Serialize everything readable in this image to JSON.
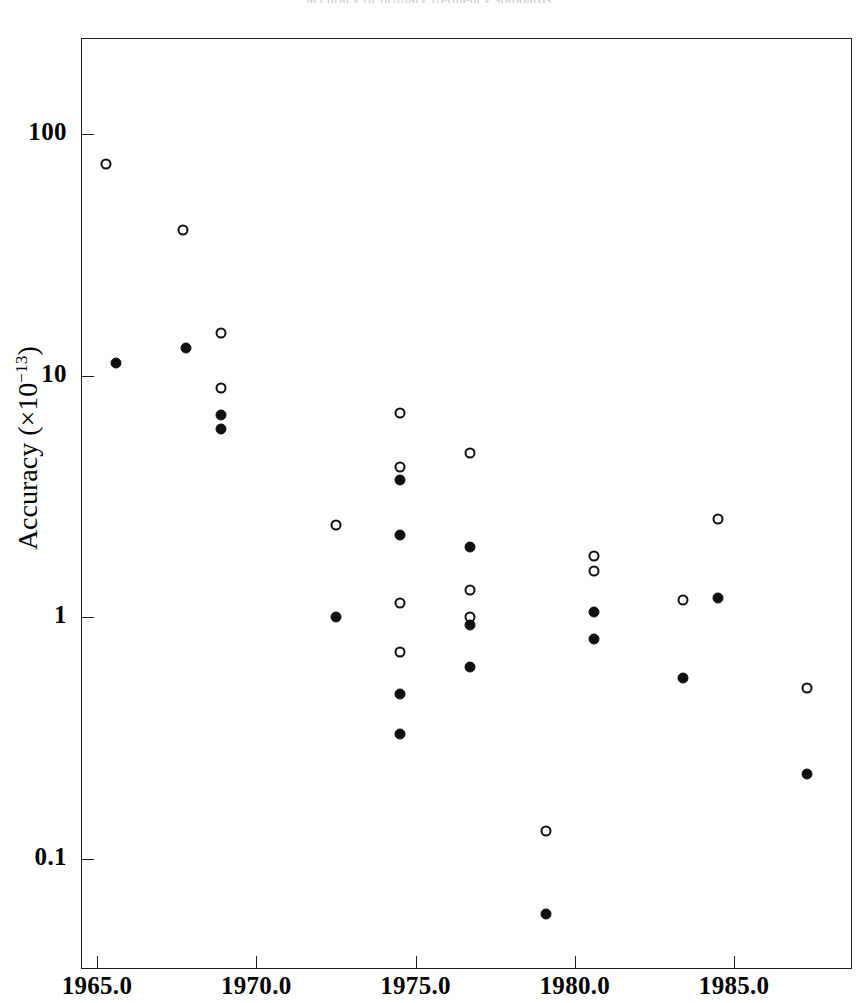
{
  "figure": {
    "title_sliver": "accuracy of primary frequency standards",
    "background": "#ffffff",
    "ink_color": "#101010"
  },
  "axes": {
    "x": {
      "label": "",
      "scale": "linear",
      "ticks": [
        "1965.0",
        "1970.0",
        "1975.0",
        "1980.0",
        "1985.0"
      ],
      "tick_values": [
        1965.0,
        1970.0,
        1975.0,
        1980.0,
        1985.0
      ],
      "range": [
        1964.5,
        1988.7
      ]
    },
    "y": {
      "label": "Accuracy (×10",
      "label_exponent": "−13",
      "label_close": ")",
      "scale": "log",
      "ticks": [
        "100",
        "10",
        "1",
        "0.1"
      ],
      "tick_values": [
        100,
        10,
        1,
        0.1
      ],
      "range": [
        0.035,
        250
      ]
    }
  },
  "chart_data": {
    "type": "scatter",
    "title": "",
    "xlabel": "",
    "ylabel": "Accuracy (×10⁻¹³)",
    "xlim": [
      1964.5,
      1988.7
    ],
    "ylim": [
      0.035,
      250
    ],
    "yscale": "log",
    "grid": false,
    "legend": "none",
    "series": [
      {
        "name": "open-circle",
        "marker": "open circle",
        "color": "#101010",
        "points": [
          {
            "x": 1965.3,
            "y": 75
          },
          {
            "x": 1967.7,
            "y": 40
          },
          {
            "x": 1968.9,
            "y": 15
          },
          {
            "x": 1968.9,
            "y": 8.9
          },
          {
            "x": 1972.5,
            "y": 2.4
          },
          {
            "x": 1974.5,
            "y": 7.0
          },
          {
            "x": 1974.5,
            "y": 4.2
          },
          {
            "x": 1974.5,
            "y": 1.15
          },
          {
            "x": 1974.5,
            "y": 0.72
          },
          {
            "x": 1976.7,
            "y": 4.8
          },
          {
            "x": 1976.7,
            "y": 1.3
          },
          {
            "x": 1976.7,
            "y": 1.0
          },
          {
            "x": 1979.1,
            "y": 0.13
          },
          {
            "x": 1980.6,
            "y": 1.8
          },
          {
            "x": 1980.6,
            "y": 1.55
          },
          {
            "x": 1983.4,
            "y": 1.18
          },
          {
            "x": 1984.5,
            "y": 2.55
          },
          {
            "x": 1987.3,
            "y": 0.51
          }
        ]
      },
      {
        "name": "filled-circle",
        "marker": "filled circle",
        "color": "#101010",
        "points": [
          {
            "x": 1965.6,
            "y": 11.3
          },
          {
            "x": 1967.8,
            "y": 13.0
          },
          {
            "x": 1968.9,
            "y": 6.9
          },
          {
            "x": 1968.9,
            "y": 6.0
          },
          {
            "x": 1972.5,
            "y": 1.0
          },
          {
            "x": 1974.5,
            "y": 3.7
          },
          {
            "x": 1974.5,
            "y": 2.2
          },
          {
            "x": 1974.5,
            "y": 0.48
          },
          {
            "x": 1974.5,
            "y": 0.33
          },
          {
            "x": 1976.7,
            "y": 1.95
          },
          {
            "x": 1976.7,
            "y": 0.93
          },
          {
            "x": 1976.7,
            "y": 0.62
          },
          {
            "x": 1979.1,
            "y": 0.059
          },
          {
            "x": 1980.6,
            "y": 1.05
          },
          {
            "x": 1980.6,
            "y": 0.81
          },
          {
            "x": 1983.4,
            "y": 0.56
          },
          {
            "x": 1984.5,
            "y": 1.2
          },
          {
            "x": 1987.3,
            "y": 0.225
          }
        ]
      }
    ]
  }
}
